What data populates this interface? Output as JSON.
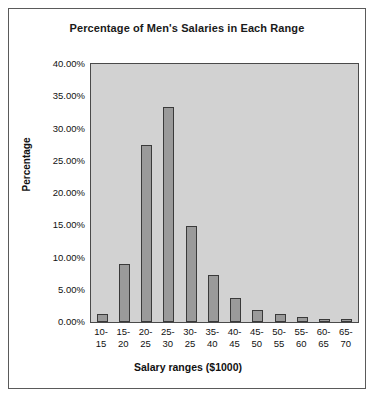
{
  "chart_data": {
    "type": "bar",
    "title": "Percentage of Men's Salaries in Each Range",
    "xlabel": "Salary ranges ($1000)",
    "ylabel": "Percentage",
    "categories": [
      "10-15",
      "15-20",
      "20-25",
      "25-30",
      "30-25",
      "35-40",
      "40-45",
      "45-50",
      "50-55",
      "55-60",
      "60-65",
      "65-70"
    ],
    "category_lines": [
      [
        "10-",
        "15"
      ],
      [
        "15-",
        "20"
      ],
      [
        "20-",
        "25"
      ],
      [
        "25-",
        "30"
      ],
      [
        "30-",
        "25"
      ],
      [
        "35-",
        "40"
      ],
      [
        "40-",
        "45"
      ],
      [
        "45-",
        "50"
      ],
      [
        "50-",
        "55"
      ],
      [
        "55-",
        "60"
      ],
      [
        "60-",
        "65"
      ],
      [
        "65-",
        "70"
      ]
    ],
    "values": [
      1.2,
      9.0,
      27.4,
      33.3,
      14.9,
      7.3,
      3.7,
      1.9,
      1.2,
      0.8,
      0.1,
      0.3
    ],
    "ylim": [
      0,
      40
    ],
    "ytick_labels": [
      "40.00%",
      "35.00%",
      "30.00%",
      "25.00%",
      "20.00%",
      "15.00%",
      "10.00%",
      "5.00%",
      "0.00%"
    ],
    "ytick_values": [
      40,
      35,
      30,
      25,
      20,
      15,
      10,
      5,
      0
    ],
    "grid": false,
    "legend": false,
    "plot_background": "#d2d2d2",
    "bar_fill": "#9a9a9a",
    "bar_border": "#3a3a3a"
  }
}
